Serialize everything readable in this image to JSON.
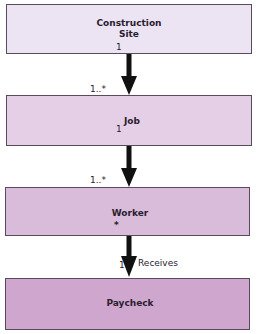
{
  "diagram": {
    "type": "uml-class-association-chain",
    "colors": {
      "box1": "#ece4f2",
      "box2": "#e4cfe6",
      "box3": "#d9bcd9",
      "box4": "#cfa6cd",
      "border": "#5a4a5e",
      "arrow": "#111111"
    },
    "nodes": [
      {
        "id": "construction-site",
        "label_line1": "Construction",
        "label_line2": "Site",
        "mult_bottom": "1"
      },
      {
        "id": "job",
        "label": "Job",
        "mult_top": "1..*",
        "mult_bottom": "1"
      },
      {
        "id": "worker",
        "label": "Worker",
        "mult_top": "1..*",
        "mult_bottom": "*"
      },
      {
        "id": "paycheck",
        "label": "Paycheck",
        "mult_top": "1"
      }
    ],
    "edges": [
      {
        "from": "construction-site",
        "to": "job",
        "source_mult": "1",
        "target_mult": "1..*"
      },
      {
        "from": "job",
        "to": "worker",
        "source_mult": "1",
        "target_mult": "1..*"
      },
      {
        "from": "worker",
        "to": "paycheck",
        "source_mult": "*",
        "target_mult": "1",
        "label": "Receives"
      }
    ]
  }
}
